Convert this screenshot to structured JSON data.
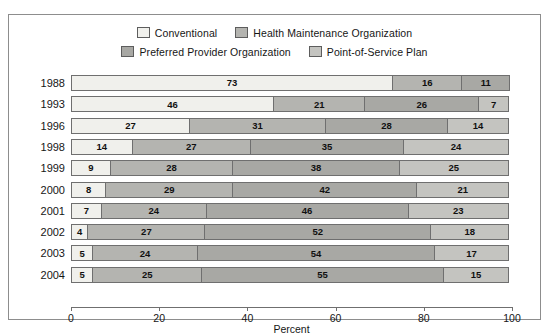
{
  "chart_data": {
    "type": "bar",
    "orientation": "horizontal",
    "stacked": true,
    "title": "",
    "xlabel": "Percent",
    "ylabel": "",
    "xlim": [
      0,
      100
    ],
    "grid": false,
    "legend_position": "top",
    "xticks": [
      0,
      20,
      40,
      60,
      80,
      100
    ],
    "categories": [
      "1988",
      "1993",
      "1996",
      "1998",
      "1999",
      "2000",
      "2001",
      "2002",
      "2003",
      "2004"
    ],
    "series": [
      {
        "name": "Conventional",
        "color": "#f0f0ec",
        "values": [
          73,
          46,
          27,
          14,
          9,
          8,
          7,
          4,
          5,
          5
        ]
      },
      {
        "name": "Health Maintenance Organization",
        "color": "#b4b4b0",
        "values": [
          16,
          21,
          31,
          27,
          28,
          29,
          24,
          27,
          24,
          25
        ]
      },
      {
        "name": "Preferred Provider Organization",
        "color": "#a8a8a4",
        "values": [
          11,
          26,
          28,
          35,
          38,
          42,
          46,
          52,
          54,
          55
        ]
      },
      {
        "name": "Point-of-Service Plan",
        "color": "#c4c4c0",
        "values": [
          0,
          7,
          14,
          24,
          25,
          21,
          23,
          18,
          17,
          15
        ]
      }
    ],
    "rows": [
      {
        "year": "1988",
        "segments": [
          {
            "series": "Conventional",
            "value": 73,
            "label": "73"
          },
          {
            "series": "Health Maintenance Organization",
            "value": 16,
            "label": "16"
          },
          {
            "series": "Preferred Provider Organization",
            "value": 11,
            "label": "11"
          }
        ]
      },
      {
        "year": "1993",
        "segments": [
          {
            "series": "Conventional",
            "value": 46,
            "label": "46"
          },
          {
            "series": "Health Maintenance Organization",
            "value": 21,
            "label": "21"
          },
          {
            "series": "Preferred Provider Organization",
            "value": 26,
            "label": "26"
          },
          {
            "series": "Point-of-Service Plan",
            "value": 7,
            "label": "7"
          }
        ]
      },
      {
        "year": "1996",
        "segments": [
          {
            "series": "Conventional",
            "value": 27,
            "label": "27"
          },
          {
            "series": "Health Maintenance Organization",
            "value": 31,
            "label": "31"
          },
          {
            "series": "Preferred Provider Organization",
            "value": 28,
            "label": "28"
          },
          {
            "series": "Point-of-Service Plan",
            "value": 14,
            "label": "14"
          }
        ]
      },
      {
        "year": "1998",
        "segments": [
          {
            "series": "Conventional",
            "value": 14,
            "label": "14"
          },
          {
            "series": "Health Maintenance Organization",
            "value": 27,
            "label": "27"
          },
          {
            "series": "Preferred Provider Organization",
            "value": 35,
            "label": "35"
          },
          {
            "series": "Point-of-Service Plan",
            "value": 24,
            "label": "24"
          }
        ]
      },
      {
        "year": "1999",
        "segments": [
          {
            "series": "Conventional",
            "value": 9,
            "label": "9"
          },
          {
            "series": "Health Maintenance Organization",
            "value": 28,
            "label": "28"
          },
          {
            "series": "Preferred Provider Organization",
            "value": 38,
            "label": "38"
          },
          {
            "series": "Point-of-Service Plan",
            "value": 25,
            "label": "25"
          }
        ]
      },
      {
        "year": "2000",
        "segments": [
          {
            "series": "Conventional",
            "value": 8,
            "label": "8"
          },
          {
            "series": "Health Maintenance Organization",
            "value": 29,
            "label": "29"
          },
          {
            "series": "Preferred Provider Organization",
            "value": 42,
            "label": "42"
          },
          {
            "series": "Point-of-Service Plan",
            "value": 21,
            "label": "21"
          }
        ]
      },
      {
        "year": "2001",
        "segments": [
          {
            "series": "Conventional",
            "value": 7,
            "label": "7"
          },
          {
            "series": "Health Maintenance Organization",
            "value": 24,
            "label": "24"
          },
          {
            "series": "Preferred Provider Organization",
            "value": 46,
            "label": "46"
          },
          {
            "series": "Point-of-Service Plan",
            "value": 23,
            "label": "23"
          }
        ]
      },
      {
        "year": "2002",
        "segments": [
          {
            "series": "Conventional",
            "value": 4,
            "label": "4"
          },
          {
            "series": "Health Maintenance Organization",
            "value": 27,
            "label": "27"
          },
          {
            "series": "Preferred Provider Organization",
            "value": 52,
            "label": "52"
          },
          {
            "series": "Point-of-Service Plan",
            "value": 18,
            "label": "18"
          }
        ]
      },
      {
        "year": "2003",
        "segments": [
          {
            "series": "Conventional",
            "value": 5,
            "label": "5"
          },
          {
            "series": "Health Maintenance Organization",
            "value": 24,
            "label": "24"
          },
          {
            "series": "Preferred Provider Organization",
            "value": 54,
            "label": "54"
          },
          {
            "series": "Point-of-Service Plan",
            "value": 17,
            "label": "17"
          }
        ]
      },
      {
        "year": "2004",
        "segments": [
          {
            "series": "Conventional",
            "value": 5,
            "label": "5"
          },
          {
            "series": "Health Maintenance Organization",
            "value": 25,
            "label": "25"
          },
          {
            "series": "Preferred Provider Organization",
            "value": 55,
            "label": "55"
          },
          {
            "series": "Point-of-Service Plan",
            "value": 15,
            "label": "15"
          }
        ]
      }
    ]
  },
  "legend": {
    "rows": [
      [
        {
          "label": "Conventional",
          "color": "#f0f0ec"
        },
        {
          "label": "Health Maintenance Organization",
          "color": "#b4b4b0"
        }
      ],
      [
        {
          "label": "Preferred Provider Organization",
          "color": "#a8a8a4"
        },
        {
          "label": "Point-of-Service Plan",
          "color": "#c4c4c0"
        }
      ]
    ]
  }
}
